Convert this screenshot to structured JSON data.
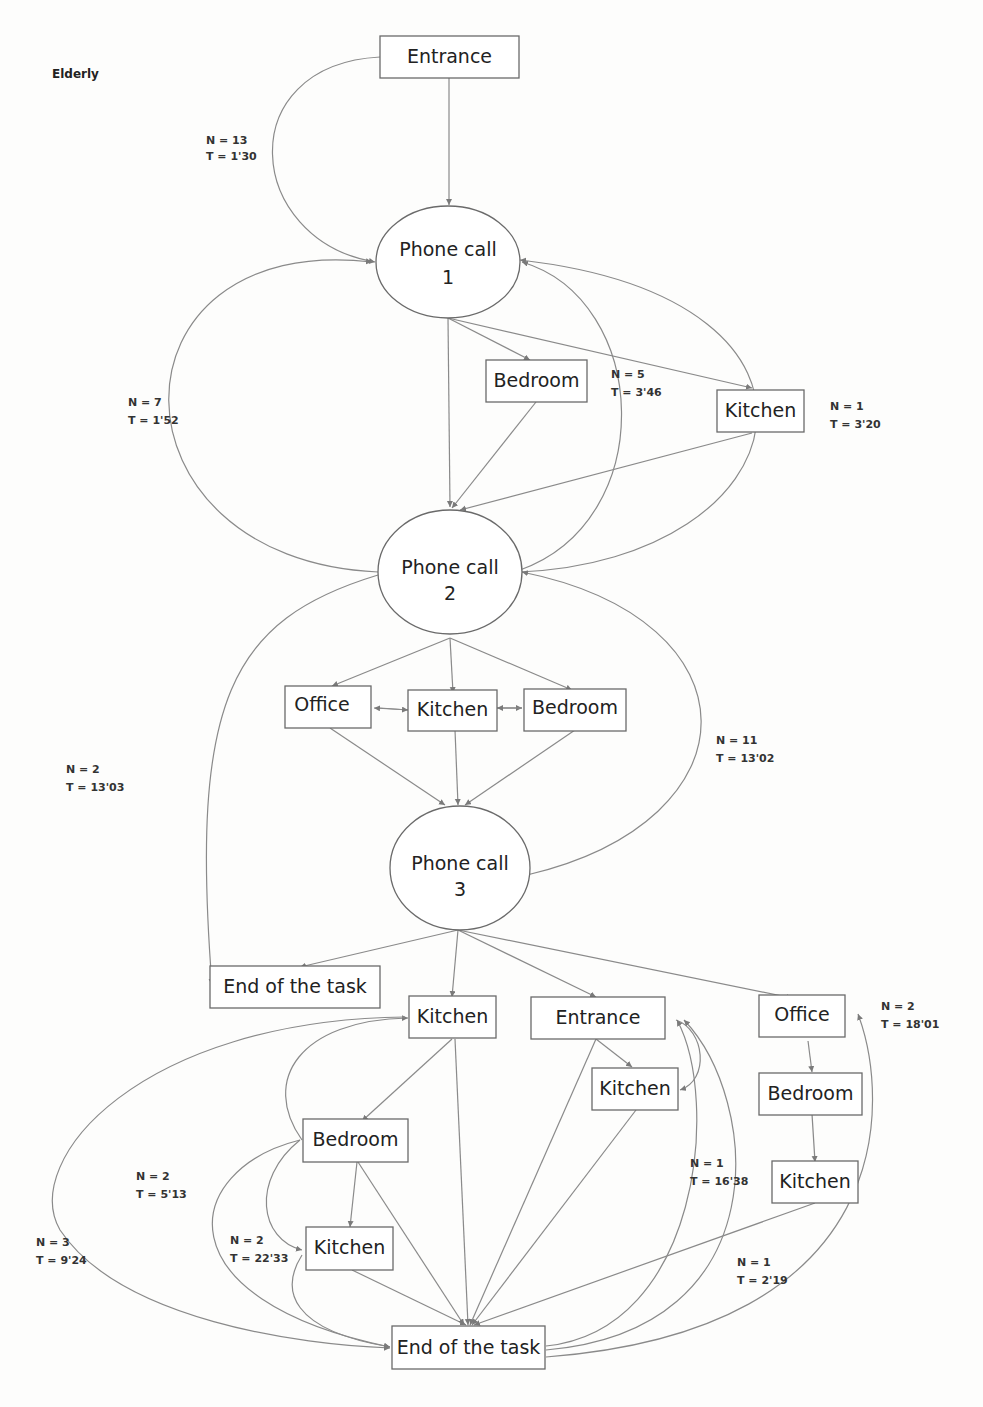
{
  "diagram": {
    "title": "Elderly",
    "nodes": {
      "entrance_top": "Entrance",
      "phone1_line1": "Phone call",
      "phone1_line2": "1",
      "bedroom_1": "Bedroom",
      "kitchen_1": "Kitchen",
      "phone2_line1": "Phone call",
      "phone2_line2": "2",
      "office_2": "Office",
      "kitchen_2": "Kitchen",
      "bedroom_2": "Bedroom",
      "phone3_line1": "Phone call",
      "phone3_line2": "3",
      "end_mid": "End of the task",
      "kitchen_3a": "Kitchen",
      "entrance_3": "Entrance",
      "office_3": "Office",
      "kitchen_3b": "Kitchen",
      "bedroom_3": "Bedroom",
      "bedroom_4": "Bedroom",
      "kitchen_4": "Kitchen",
      "kitchen_5": "Kitchen",
      "end_bottom": "End of the task"
    },
    "edge_labels": [
      {
        "n": "N = 13",
        "t": "T = 1'30"
      },
      {
        "n": "N = 7",
        "t": "T = 1'52"
      },
      {
        "n": "N = 5",
        "t": "T = 3'46"
      },
      {
        "n": "N = 1",
        "t": "T = 3'20"
      },
      {
        "n": "N = 2",
        "t": "T = 13'03"
      },
      {
        "n": "N = 11",
        "t": "T = 13'02"
      },
      {
        "n": "N = 2",
        "t": "T = 18'01"
      },
      {
        "n": "N = 2",
        "t": "T = 5'13"
      },
      {
        "n": "N = 1",
        "t": "T = 16'38"
      },
      {
        "n": "N = 3",
        "t": "T = 9'24"
      },
      {
        "n": "N = 2",
        "t": "T = 22'33"
      },
      {
        "n": "N = 1",
        "t": "T = 2'19"
      }
    ]
  },
  "colors": {
    "stroke": "#6a6a6a",
    "edge": "#8a8a8a",
    "text": "#222222",
    "background": "#fdfdfc"
  }
}
